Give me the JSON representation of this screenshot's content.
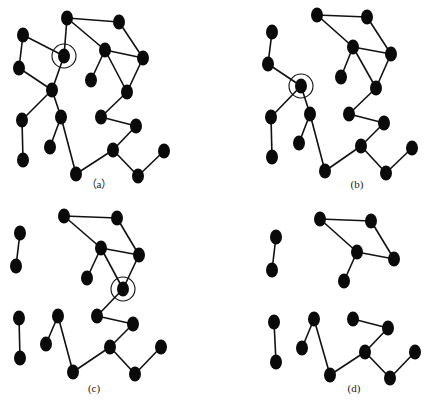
{
  "figure": {
    "colors": {
      "node": "#0a0a0a",
      "edge": "#111111",
      "ring": "#111111",
      "background": "#ffffff"
    },
    "node_size": {
      "rx": 6,
      "ry": 7.5
    },
    "panels": [
      {
        "label": "（a）",
        "label_pos": [
          99,
          188
        ],
        "highlight": {
          "cx": 64,
          "cy": 56,
          "r": 12
        },
        "nodes": [
          [
            67,
            18
          ],
          [
            119,
            22
          ],
          [
            23,
            35
          ],
          [
            64,
            56
          ],
          [
            105,
            50
          ],
          [
            143,
            58
          ],
          [
            19,
            68
          ],
          [
            91,
            80
          ],
          [
            52,
            90
          ],
          [
            127,
            92
          ],
          [
            22,
            120
          ],
          [
            61,
            117
          ],
          [
            101,
            117
          ],
          [
            136,
            126
          ],
          [
            50,
            147
          ],
          [
            113,
            150
          ],
          [
            164,
            151
          ],
          [
            23,
            160
          ],
          [
            76,
            174
          ],
          [
            138,
            176
          ]
        ],
        "edges": [
          [
            0,
            1
          ],
          [
            0,
            3
          ],
          [
            0,
            4
          ],
          [
            1,
            5
          ],
          [
            2,
            3
          ],
          [
            2,
            6
          ],
          [
            3,
            8
          ],
          [
            4,
            5
          ],
          [
            4,
            7
          ],
          [
            4,
            9
          ],
          [
            5,
            9
          ],
          [
            6,
            8
          ],
          [
            8,
            10
          ],
          [
            8,
            11
          ],
          [
            9,
            12
          ],
          [
            10,
            17
          ],
          [
            11,
            14
          ],
          [
            11,
            18
          ],
          [
            12,
            13
          ],
          [
            13,
            15
          ],
          [
            15,
            18
          ],
          [
            15,
            19
          ],
          [
            16,
            19
          ]
        ]
      },
      {
        "label": "(b)",
        "label_pos": [
          357,
          188
        ],
        "highlight": {
          "cx": 301,
          "cy": 86,
          "r": 12
        },
        "nodes": [
          [
            317,
            15
          ],
          [
            367,
            17
          ],
          [
            272,
            32
          ],
          [
            353,
            47
          ],
          [
            391,
            54
          ],
          [
            268,
            64
          ],
          [
            341,
            77
          ],
          [
            301,
            86
          ],
          [
            376,
            88
          ],
          [
            271,
            117
          ],
          [
            310,
            114
          ],
          [
            349,
            114
          ],
          [
            384,
            123
          ],
          [
            299,
            143
          ],
          [
            361,
            146
          ],
          [
            412,
            148
          ],
          [
            272,
            157
          ],
          [
            325,
            171
          ],
          [
            386,
            173
          ]
        ],
        "edges": [
          [
            0,
            1
          ],
          [
            0,
            3
          ],
          [
            1,
            4
          ],
          [
            2,
            5
          ],
          [
            3,
            4
          ],
          [
            3,
            6
          ],
          [
            3,
            8
          ],
          [
            4,
            8
          ],
          [
            5,
            7
          ],
          [
            7,
            9
          ],
          [
            7,
            10
          ],
          [
            8,
            11
          ],
          [
            9,
            16
          ],
          [
            10,
            13
          ],
          [
            10,
            17
          ],
          [
            11,
            12
          ],
          [
            12,
            14
          ],
          [
            14,
            17
          ],
          [
            14,
            18
          ],
          [
            15,
            18
          ]
        ]
      },
      {
        "label": "(c)",
        "label_pos": [
          94,
          392
        ],
        "highlight": {
          "cx": 123,
          "cy": 289,
          "r": 12
        },
        "nodes": [
          [
            64,
            216
          ],
          [
            117,
            218
          ],
          [
            20,
            233
          ],
          [
            101,
            248
          ],
          [
            139,
            255
          ],
          [
            16,
            266
          ],
          [
            87,
            278
          ],
          [
            123,
            289
          ],
          [
            19,
            318
          ],
          [
            58,
            316
          ],
          [
            97,
            316
          ],
          [
            133,
            324
          ],
          [
            46,
            344
          ],
          [
            110,
            347
          ],
          [
            161,
            347
          ],
          [
            20,
            358
          ],
          [
            73,
            372
          ],
          [
            135,
            374
          ]
        ],
        "edges": [
          [
            0,
            1
          ],
          [
            0,
            3
          ],
          [
            1,
            4
          ],
          [
            2,
            5
          ],
          [
            3,
            4
          ],
          [
            3,
            6
          ],
          [
            3,
            7
          ],
          [
            4,
            7
          ],
          [
            7,
            10
          ],
          [
            8,
            15
          ],
          [
            9,
            12
          ],
          [
            9,
            16
          ],
          [
            10,
            11
          ],
          [
            11,
            13
          ],
          [
            13,
            16
          ],
          [
            13,
            17
          ],
          [
            14,
            17
          ]
        ]
      },
      {
        "label": "(d)",
        "label_pos": [
          354,
          392
        ],
        "highlight": null,
        "nodes": [
          [
            320,
            219
          ],
          [
            371,
            221
          ],
          [
            276,
            237
          ],
          [
            357,
            252
          ],
          [
            394,
            259
          ],
          [
            272,
            270
          ],
          [
            344,
            281
          ],
          [
            274,
            322
          ],
          [
            314,
            319
          ],
          [
            353,
            319
          ],
          [
            388,
            328
          ],
          [
            302,
            348
          ],
          [
            365,
            352
          ],
          [
            415,
            352
          ],
          [
            276,
            362
          ],
          [
            330,
            375
          ],
          [
            390,
            378
          ]
        ],
        "edges": [
          [
            0,
            1
          ],
          [
            0,
            3
          ],
          [
            1,
            4
          ],
          [
            2,
            5
          ],
          [
            3,
            4
          ],
          [
            3,
            6
          ],
          [
            7,
            14
          ],
          [
            8,
            11
          ],
          [
            8,
            15
          ],
          [
            9,
            10
          ],
          [
            10,
            12
          ],
          [
            12,
            15
          ],
          [
            12,
            16
          ],
          [
            13,
            16
          ]
        ]
      }
    ]
  }
}
